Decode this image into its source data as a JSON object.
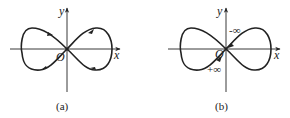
{
  "figures": [
    {
      "id": "a",
      "caption": "(a)",
      "x_label": "x",
      "y_label": "y",
      "origin_label": "O",
      "curve": "lemniscate",
      "arrows": "four direction arrows along the loops"
    },
    {
      "id": "b",
      "caption": "(b)",
      "x_label": "x",
      "y_label": "y",
      "origin_label": "O",
      "curve": "lemniscate",
      "annotations": [
        "-∞",
        "+∞"
      ]
    }
  ],
  "colors": {
    "ink": "#222222",
    "background": "#ffffff"
  }
}
